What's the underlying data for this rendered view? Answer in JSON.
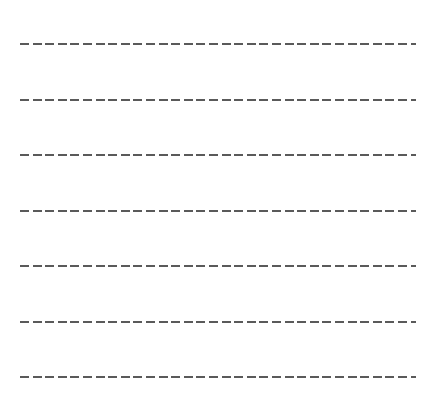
{
  "lines": {
    "count": 7,
    "style": "dashed",
    "color": "#5a5a5a",
    "positions_y": [
      43,
      99,
      154,
      210,
      265,
      321,
      376
    ]
  }
}
